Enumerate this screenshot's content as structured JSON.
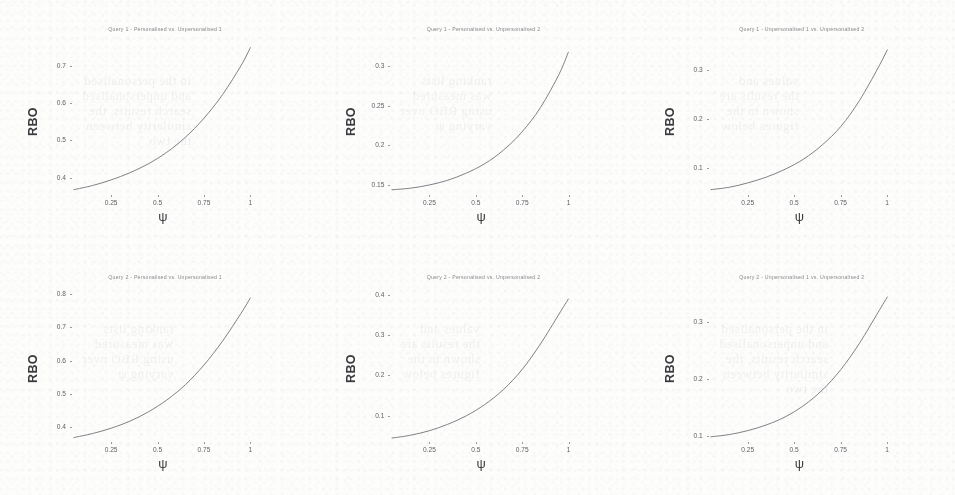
{
  "figure": {
    "kind": "scanned-figure",
    "rows": 2,
    "cols": 3,
    "ylabel": "RBO",
    "xlabel": "ψ",
    "line_color": "#6a6a72",
    "background_color": "#fdfdfc"
  },
  "ghost_text": {
    "a": "in the personalised\nand unpersonalised\nsearch results, the\nsimilarity between\nthe two",
    "b": "ranking lists\nwas measured\nusing RBO over\nvarying ψ",
    "c": "values and\nthe results are\nshown in the\nfigures below"
  },
  "chart_data": [
    {
      "type": "line",
      "title": "Query 1 - Personalised vs. Unpersonalised 1",
      "xlabel": "ψ",
      "ylabel": "RBO",
      "xticks": [
        0.25,
        0.5,
        0.75,
        1
      ],
      "xtick_labels": [
        "0.25",
        "0.5",
        "0.75",
        "1"
      ],
      "yticks": [
        0.4,
        0.5,
        0.6,
        0.7
      ],
      "ytick_labels": [
        "0.4",
        "0.5",
        "0.6",
        "0.7"
      ],
      "xlim": [
        0.05,
        1.0
      ],
      "ylim": [
        0.355,
        0.755
      ],
      "x": [
        0.05,
        0.15,
        0.25,
        0.35,
        0.45,
        0.55,
        0.65,
        0.75,
        0.85,
        0.95,
        1.0
      ],
      "y": [
        0.368,
        0.379,
        0.394,
        0.413,
        0.437,
        0.468,
        0.508,
        0.559,
        0.622,
        0.7,
        0.748
      ]
    },
    {
      "type": "line",
      "title": "Query 1 - Personalised vs. Unpersonalised 2",
      "xlabel": "ψ",
      "ylabel": "RBO",
      "xticks": [
        0.25,
        0.5,
        0.75,
        1
      ],
      "xtick_labels": [
        "0.25",
        "0.5",
        "0.75",
        "1"
      ],
      "yticks": [
        0.15,
        0.2,
        0.25,
        0.3
      ],
      "ytick_labels": [
        "0.15",
        "0.2",
        "0.25",
        "0.3"
      ],
      "xlim": [
        0.05,
        1.0
      ],
      "ylim": [
        0.138,
        0.327
      ],
      "x": [
        0.05,
        0.15,
        0.25,
        0.35,
        0.45,
        0.55,
        0.65,
        0.75,
        0.85,
        0.95,
        1.0
      ],
      "y": [
        0.144,
        0.146,
        0.15,
        0.156,
        0.165,
        0.177,
        0.194,
        0.217,
        0.248,
        0.29,
        0.318
      ]
    },
    {
      "type": "line",
      "title": "Query 1 - Unpersonalised 1 vs. Unpersonalised 2",
      "xlabel": "ψ",
      "ylabel": "RBO",
      "xticks": [
        0.25,
        0.5,
        0.75,
        1
      ],
      "xtick_labels": [
        "0.25",
        "0.5",
        "0.75",
        "1"
      ],
      "yticks": [
        0.1,
        0.2,
        0.3
      ],
      "ytick_labels": [
        "0.1",
        "0.2",
        "0.3"
      ],
      "xlim": [
        0.05,
        1.0
      ],
      "ylim": [
        0.045,
        0.352
      ],
      "x": [
        0.05,
        0.15,
        0.25,
        0.35,
        0.45,
        0.55,
        0.65,
        0.75,
        0.85,
        0.95,
        1.0
      ],
      "y": [
        0.055,
        0.06,
        0.069,
        0.081,
        0.097,
        0.118,
        0.147,
        0.185,
        0.238,
        0.305,
        0.342
      ]
    },
    {
      "type": "line",
      "title": "Query 2 - Personalised vs. Unpersonalised 1",
      "xlabel": "ψ",
      "ylabel": "RBO",
      "xticks": [
        0.25,
        0.5,
        0.75,
        1
      ],
      "xtick_labels": [
        "0.25",
        "0.5",
        "0.75",
        "1"
      ],
      "yticks": [
        0.4,
        0.5,
        0.6,
        0.7,
        0.8
      ],
      "ytick_labels": [
        "0.4",
        "0.5",
        "0.6",
        "0.7",
        "0.8"
      ],
      "xlim": [
        0.05,
        1.0
      ],
      "ylim": [
        0.355,
        0.805
      ],
      "x": [
        0.05,
        0.15,
        0.25,
        0.35,
        0.45,
        0.55,
        0.65,
        0.75,
        0.85,
        0.95,
        1.0
      ],
      "y": [
        0.37,
        0.382,
        0.398,
        0.419,
        0.447,
        0.483,
        0.529,
        0.588,
        0.66,
        0.744,
        0.79
      ]
    },
    {
      "type": "line",
      "title": "Query 2 - Personalised vs. Unpersonalised 2",
      "xlabel": "ψ",
      "ylabel": "RBO",
      "xticks": [
        0.25,
        0.5,
        0.75,
        1
      ],
      "xtick_labels": [
        "0.25",
        "0.5",
        "0.75",
        "1"
      ],
      "yticks": [
        0.1,
        0.2,
        0.3,
        0.4
      ],
      "ytick_labels": [
        "0.1",
        "0.2",
        "0.3",
        "0.4"
      ],
      "xlim": [
        0.05,
        1.0
      ],
      "ylim": [
        0.035,
        0.405
      ],
      "x": [
        0.05,
        0.15,
        0.25,
        0.35,
        0.45,
        0.55,
        0.65,
        0.75,
        0.85,
        0.95,
        1.0
      ],
      "y": [
        0.046,
        0.053,
        0.064,
        0.08,
        0.101,
        0.129,
        0.166,
        0.215,
        0.279,
        0.353,
        0.39
      ]
    },
    {
      "type": "line",
      "title": "Query 2 - Unpersonalised 1 vs. Unpersonalised 2",
      "xlabel": "ψ",
      "ylabel": "RBO",
      "xticks": [
        0.25,
        0.5,
        0.75,
        1
      ],
      "xtick_labels": [
        "0.25",
        "0.5",
        "0.75",
        "1"
      ],
      "yticks": [
        0.1,
        0.2,
        0.3
      ],
      "ytick_labels": [
        "0.1",
        "0.2",
        "0.3"
      ],
      "xlim": [
        0.05,
        1.0
      ],
      "ylim": [
        0.09,
        0.352
      ],
      "x": [
        0.05,
        0.15,
        0.25,
        0.35,
        0.45,
        0.55,
        0.65,
        0.75,
        0.85,
        0.95,
        1.0
      ],
      "y": [
        0.1,
        0.104,
        0.111,
        0.121,
        0.135,
        0.155,
        0.182,
        0.218,
        0.264,
        0.318,
        0.345
      ]
    }
  ]
}
